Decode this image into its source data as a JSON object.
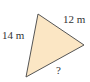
{
  "diagram": {
    "shape": "triangle",
    "fill_color": "#fbe6c4",
    "stroke_color": "#555555",
    "vertices": [
      [
        38,
        14
      ],
      [
        84,
        45
      ],
      [
        26,
        77
      ]
    ],
    "labels": {
      "left_side": "14 m",
      "right_side": "12 m",
      "bottom_side": "?"
    }
  }
}
